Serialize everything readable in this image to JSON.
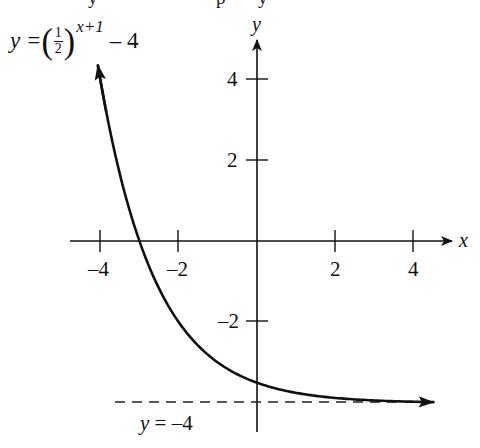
{
  "top_cutoff_text": "y   p   y",
  "chart_data": {
    "type": "line",
    "title": "",
    "function": {
      "expression": "y = (1/2)^(x+1) - 4",
      "base": 0.5,
      "shift_x": 1,
      "shift_y": -4,
      "x_range_drawn": [
        -4.06,
        4.5
      ]
    },
    "series": [
      {
        "name": "y = (1/2)^(x+1) - 4",
        "x": [
          -4,
          -3,
          -2,
          -1,
          0,
          1,
          2,
          3,
          4
        ],
        "y": [
          4,
          0,
          -2,
          -3,
          -3.5,
          -3.75,
          -3.875,
          -3.9375,
          -3.96875
        ]
      }
    ],
    "asymptote": {
      "type": "horizontal",
      "y": -4,
      "label": "y = –4",
      "style": "dashed"
    },
    "xlabel": "x",
    "ylabel": "y",
    "x_ticks": [
      -4,
      -2,
      2,
      4
    ],
    "x_tick_labels": [
      "–4",
      "–2",
      "2",
      "4"
    ],
    "y_ticks": [
      4,
      2,
      -2
    ],
    "y_tick_labels": [
      "4",
      "2",
      "–2"
    ],
    "xlim": [
      -4.5,
      4.9
    ],
    "ylim": [
      -4.7,
      5.0
    ],
    "grid": false,
    "legend": "none",
    "annotations": [
      {
        "text": "y = (1/2)^(x+1) – 4",
        "position": "top-left"
      },
      {
        "text": "y = –4",
        "position": "bottom-left, below asymptote"
      }
    ],
    "colors": {
      "curve": "#111111",
      "axes": "#111111",
      "asymptote": "#222222"
    }
  },
  "labels": {
    "formula_lhs": "y = ",
    "formula_frac_num": "1",
    "formula_frac_den": "2",
    "formula_paren_open": "(",
    "formula_paren_close": ")",
    "formula_exponent": "x+1",
    "formula_tail": " – 4",
    "asymptote_label": "y = –4",
    "x_axis_label": "x",
    "y_axis_label": "y",
    "x_tick_neg4": "–4",
    "x_tick_neg2": "–2",
    "x_tick_2": "2",
    "x_tick_4": "4",
    "y_tick_4": "4",
    "y_tick_2": "2",
    "y_tick_neg2": "–2"
  }
}
